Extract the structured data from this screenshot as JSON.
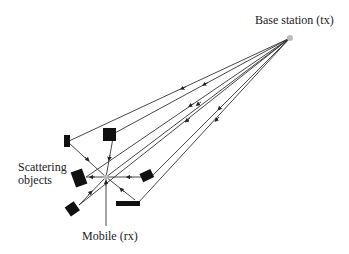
{
  "labels": {
    "base_station": "Base station (tx)",
    "scattering_line1": "Scattering",
    "scattering_line2": "objects",
    "mobile": "Mobile (rx)"
  },
  "colors": {
    "line": "#333333",
    "scatterer": "#111111",
    "node": "#bbbbbb"
  },
  "nodes": {
    "base_station": {
      "x": 290,
      "y": 38
    },
    "mobile": {
      "x": 106,
      "y": 177
    }
  },
  "scatterers": [
    {
      "name": "scatterer-top-left",
      "x": 67,
      "y": 141
    },
    {
      "name": "scatterer-top",
      "x": 109,
      "y": 134
    },
    {
      "name": "scatterer-left",
      "x": 79,
      "y": 177
    },
    {
      "name": "scatterer-right",
      "x": 147,
      "y": 176
    },
    {
      "name": "scatterer-bottom-right",
      "x": 128,
      "y": 203
    },
    {
      "name": "scatterer-bottom-left",
      "x": 73,
      "y": 209
    }
  ]
}
